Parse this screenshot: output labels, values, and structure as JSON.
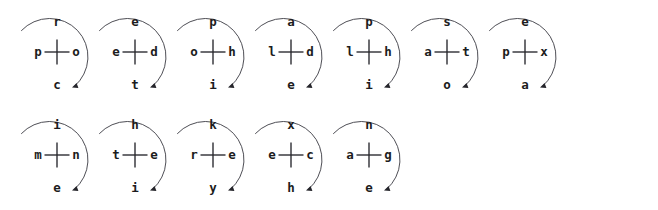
{
  "diagram": {
    "background_color": "#ffffff",
    "line_color": "#3a3a42",
    "text_color": "#1c1c20",
    "rotation_direction": "clockwise",
    "cell_count": 12,
    "rows": [
      {
        "row_index": 0,
        "cells": [
          {
            "left": "p",
            "top": "r",
            "right": "o",
            "bottom": "c"
          },
          {
            "left": "e",
            "top": "e",
            "right": "d",
            "bottom": "t"
          },
          {
            "left": "o",
            "top": "p",
            "right": "h",
            "bottom": "i"
          },
          {
            "left": "l",
            "top": "a",
            "right": "d",
            "bottom": "e"
          },
          {
            "left": "l",
            "top": "p",
            "right": "h",
            "bottom": "i"
          },
          {
            "left": "a",
            "top": "s",
            "right": "t",
            "bottom": "o"
          },
          {
            "left": "p",
            "top": "e",
            "right": "x",
            "bottom": "a"
          }
        ]
      },
      {
        "row_index": 1,
        "cells": [
          {
            "left": "m",
            "top": "i",
            "right": "n",
            "bottom": "e"
          },
          {
            "left": "t",
            "top": "h",
            "right": "e",
            "bottom": "i"
          },
          {
            "left": "r",
            "top": "k",
            "right": "e",
            "bottom": "y"
          },
          {
            "left": "e",
            "top": "x",
            "right": "c",
            "bottom": "h"
          },
          {
            "left": "a",
            "top": "n",
            "right": "g",
            "bottom": "e"
          }
        ]
      }
    ]
  }
}
